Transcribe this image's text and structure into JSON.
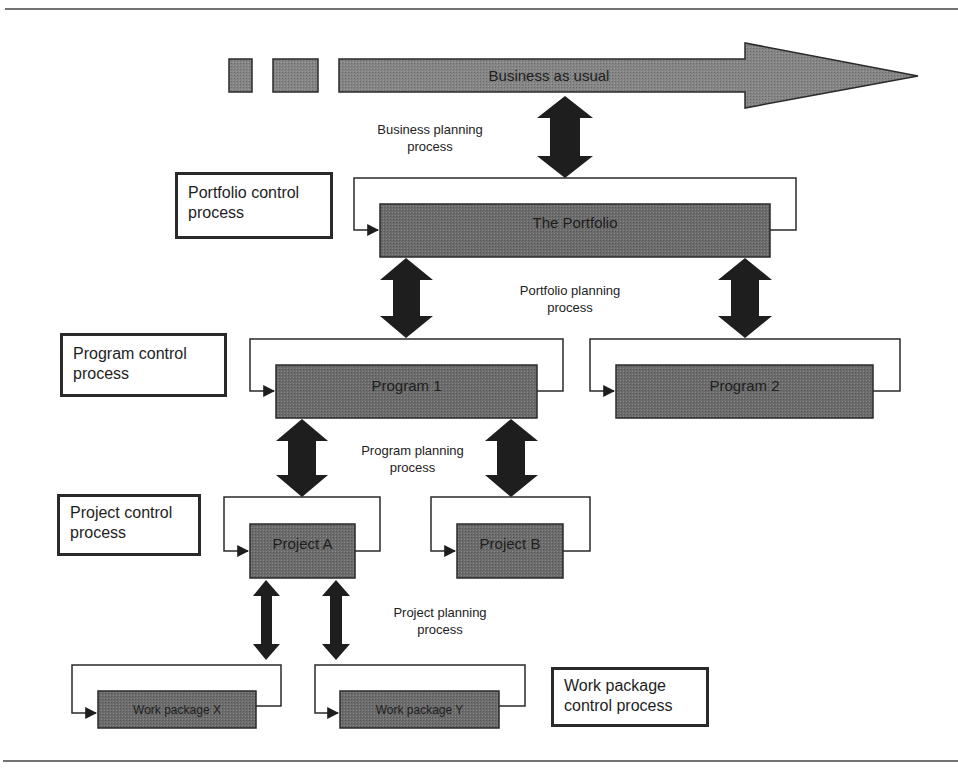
{
  "diagram": {
    "business": {
      "label": "Business as usual"
    },
    "planning_processes": {
      "business": [
        "Business planning",
        "process"
      ],
      "portfolio": [
        "Portfolio planning",
        "process"
      ],
      "program": [
        "Program planning",
        "process"
      ],
      "project": [
        "Project planning",
        "process"
      ]
    },
    "control_processes": {
      "portfolio": [
        "Portfolio control",
        "process"
      ],
      "program": [
        "Program control",
        "process"
      ],
      "project": [
        "Project control",
        "process"
      ],
      "work_package": [
        "Work package",
        "control process"
      ]
    },
    "nodes": {
      "portfolio": "The Portfolio",
      "program_1": "Program 1",
      "program_2": "Program 2",
      "project_a": "Project A",
      "project_b": "Project B",
      "work_package_x": "Work package X",
      "work_package_y": "Work package Y"
    },
    "colors": {
      "box_fill": "#7a7a7a",
      "arrow_fill": "#1e1e1e",
      "line": "#2a2a2a"
    }
  }
}
